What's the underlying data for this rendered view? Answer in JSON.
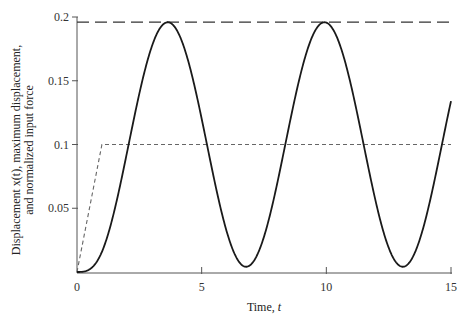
{
  "chart_data": {
    "type": "line",
    "title": "",
    "xlabel": "Time, t",
    "ylabel_line1": "Displacement x(t), maximum displacement,",
    "ylabel_line2": "and normalized input force",
    "xlim": [
      0,
      15
    ],
    "ylim": [
      0,
      0.2
    ],
    "xticks": [
      0,
      5,
      10,
      15
    ],
    "xtick_labels": [
      "0",
      "5",
      "10",
      "15"
    ],
    "yticks": [
      0.05,
      0.1,
      0.15,
      0.2
    ],
    "ytick_labels": [
      "0.05",
      "0.1",
      "0.15",
      "0.2"
    ],
    "grid": false,
    "legend": null,
    "series": [
      {
        "name": "Displacement x(t)",
        "style": "solid",
        "color": "#1a1a1a",
        "x": [
          0,
          0.5,
          1,
          1.5,
          2,
          2.5,
          3,
          3.5,
          3.7,
          4,
          4.5,
          5,
          5.5,
          6,
          6.5,
          6.9,
          7.5,
          8,
          8.5,
          9,
          9.5,
          10,
          10.5,
          11,
          11.5,
          12,
          12.5,
          13.1,
          13.5,
          14,
          14.5,
          15
        ],
        "y": [
          0,
          0.002,
          0.016,
          0.042,
          0.075,
          0.112,
          0.146,
          0.176,
          0.19,
          0.195,
          0.187,
          0.165,
          0.13,
          0.093,
          0.052,
          0.02,
          0.01,
          0.03,
          0.058,
          0.095,
          0.13,
          0.165,
          0.188,
          0.195,
          0.185,
          0.158,
          0.12,
          0.005,
          0.02,
          0.055,
          0.09,
          0.134
        ]
      },
      {
        "name": "Maximum displacement",
        "style": "long-dash",
        "color": "#1a1a1a",
        "x": [
          0,
          15
        ],
        "y": [
          0.196,
          0.196
        ]
      },
      {
        "name": "Normalized input force (ramp)",
        "style": "short-dash",
        "color": "#555555",
        "x": [
          0,
          1,
          15
        ],
        "y": [
          0,
          0.1,
          0.1
        ]
      }
    ],
    "model": {
      "description": "Ramp-step response, ramp duration 1, final level 0.1, natural frequency 1 rad/s",
      "ramp_time": 1,
      "force_level": 0.1,
      "omega": 1
    }
  }
}
